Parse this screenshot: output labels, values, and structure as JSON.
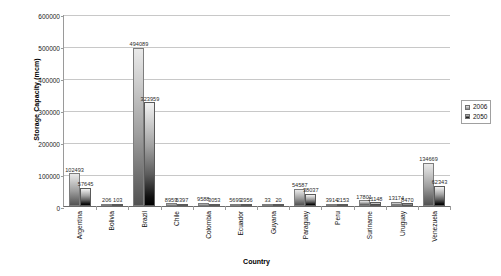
{
  "chart_data": {
    "type": "bar",
    "title": "",
    "xlabel": "Country",
    "ylabel": "Storage Capacity (mcm)",
    "ylim": [
      0,
      600000
    ],
    "ytick_labels": [
      "0",
      "100000",
      "200000",
      "300000",
      "400000",
      "500000",
      "600000"
    ],
    "ytick_values": [
      0,
      100000,
      200000,
      300000,
      400000,
      500000,
      600000
    ],
    "grid": true,
    "legend_position": "right",
    "categories": [
      "Argentina",
      "Bolivia",
      "Brazil",
      "Chile",
      "Colombia",
      "Ecuador",
      "Guyana",
      "Paraguay",
      "Peru",
      "Suriname",
      "Uruguay",
      "Venezuela"
    ],
    "series": [
      {
        "name": "2006",
        "color": "#9e9e9e",
        "values": [
          102493,
          206,
          494089,
          8959,
          9588,
          5699,
          33,
          54587,
          3914,
          17801,
          13174,
          134669
        ],
        "labels": [
          "102493",
          "206",
          "494089",
          "8959",
          "9588",
          "5699",
          "33",
          "54587",
          "3914",
          "17801",
          "13174",
          "134669"
        ]
      },
      {
        "name": "2050",
        "color": "#000000",
        "values": [
          57645,
          103,
          323959,
          5397,
          3053,
          2956,
          20,
          38037,
          2153,
          11148,
          8470,
          62343
        ],
        "labels": [
          "57645",
          "103",
          "323959",
          "5397",
          "3053",
          "2956",
          "20",
          "38037",
          "2153",
          "11148",
          "8470",
          "62343"
        ]
      }
    ]
  },
  "legend": {
    "items": [
      {
        "label": "2006",
        "swatch": "s2006"
      },
      {
        "label": "2050",
        "swatch": "s2050"
      }
    ]
  }
}
